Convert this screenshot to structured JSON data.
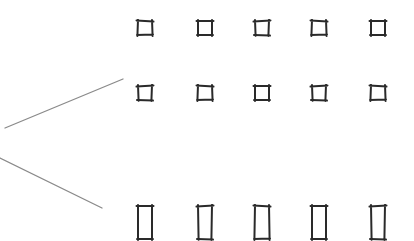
{
  "diagram": {
    "stroke_color": "#2a2a2a",
    "line_color": "#8a8a8a",
    "columns_x": [
      145,
      205,
      262,
      319,
      378
    ],
    "rows": [
      {
        "name": "top-squares",
        "y": 21,
        "w": 14,
        "h": 14,
        "count": 5
      },
      {
        "name": "middle-squares",
        "y": 86,
        "w": 14,
        "h": 14,
        "count": 5
      },
      {
        "name": "bottom-rectangles",
        "y": 206,
        "w": 14,
        "h": 33,
        "count": 5
      }
    ],
    "lines": [
      {
        "name": "upper-diverging-line",
        "x1": 5,
        "y1": 128,
        "x2": 123,
        "y2": 79
      },
      {
        "name": "lower-diverging-line",
        "x1": 0,
        "y1": 158,
        "x2": 102,
        "y2": 208
      }
    ]
  }
}
